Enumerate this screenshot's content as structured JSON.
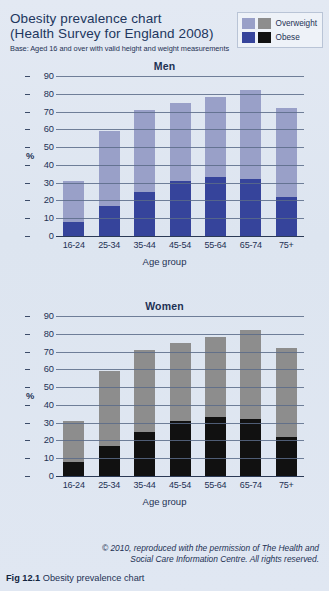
{
  "header": {
    "title_line1": "Obesity prevalence chart",
    "title_line2": "(Health Survey for England 2008)",
    "base_note": "Base: Aged 16 and over with valid height and weight measurements"
  },
  "legend": {
    "rows": [
      {
        "label": "Overweight",
        "color_men": "#99a0c8",
        "color_women": "#8d8d8d"
      },
      {
        "label": "Obese",
        "color_men": "#36449b",
        "color_women": "#111111"
      }
    ]
  },
  "footer": {
    "credit_line1": "© 2010, reproduced with the permission of The Health and",
    "credit_line2": "Social Care Information Centre. All rights reserved.",
    "caption_prefix": "Fig 12.1",
    "caption_text": "Obesity prevalence chart"
  },
  "colors": {
    "page_background": "#dfe6f0",
    "overweight_men": "#99a0c8",
    "obese_men": "#36449b",
    "overweight_women": "#8d8d8d",
    "obese_women": "#111111",
    "gridline": "#5a6b88",
    "text": "#1d3154"
  },
  "chart_data": [
    {
      "type": "bar",
      "subtype": "stacked",
      "title": "Men",
      "xlabel": "Age group",
      "ylabel": "%",
      "ylim": [
        0,
        90
      ],
      "yticks": [
        0,
        10,
        20,
        30,
        40,
        50,
        60,
        70,
        80,
        90
      ],
      "grid": true,
      "legend_position": "top-right",
      "categories": [
        "16-24",
        "25-34",
        "35-44",
        "45-54",
        "55-64",
        "65-74",
        "75+"
      ],
      "series": [
        {
          "name": "Obese",
          "color": "#36449b",
          "values": [
            8,
            17,
            25,
            31,
            33,
            32,
            22
          ]
        },
        {
          "name": "Overweight",
          "color": "#99a0c8",
          "values": [
            23,
            42,
            46,
            44,
            45,
            50,
            50
          ]
        }
      ],
      "totals": [
        31,
        59,
        71,
        75,
        78,
        82,
        72
      ]
    },
    {
      "type": "bar",
      "subtype": "stacked",
      "title": "Women",
      "xlabel": "Age group",
      "ylabel": "%",
      "ylim": [
        0,
        90
      ],
      "yticks": [
        0,
        10,
        20,
        30,
        40,
        50,
        60,
        70,
        80,
        90
      ],
      "grid": true,
      "legend_position": "top-right",
      "categories": [
        "16-24",
        "25-34",
        "35-44",
        "45-54",
        "55-64",
        "65-74",
        "75+"
      ],
      "series": [
        {
          "name": "Obese",
          "color": "#111111",
          "values": [
            8,
            17,
            25,
            31,
            33,
            32,
            22
          ]
        },
        {
          "name": "Overweight",
          "color": "#8d8d8d",
          "values": [
            23,
            42,
            46,
            44,
            45,
            50,
            50
          ]
        }
      ],
      "totals": [
        31,
        59,
        71,
        75,
        78,
        82,
        72
      ]
    }
  ]
}
